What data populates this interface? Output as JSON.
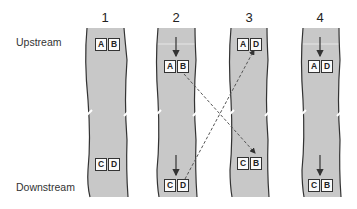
{
  "labels": {
    "upstream": "Upstream",
    "downstream": "Downstream"
  },
  "columns": [
    {
      "number": "1",
      "top": [
        "A",
        "B"
      ],
      "bottom": [
        "C",
        "D"
      ]
    },
    {
      "number": "2",
      "top": [
        "A",
        "B"
      ],
      "bottom": [
        "C",
        "D"
      ]
    },
    {
      "number": "3",
      "top": [
        "A",
        "D"
      ],
      "bottom": [
        "C",
        "B"
      ]
    },
    {
      "number": "4",
      "top": [
        "A",
        "D"
      ],
      "bottom": [
        "C",
        "B"
      ]
    }
  ],
  "colors": {
    "river": "#c8c8c8",
    "bank": "#333333",
    "arrow": "#444444"
  }
}
